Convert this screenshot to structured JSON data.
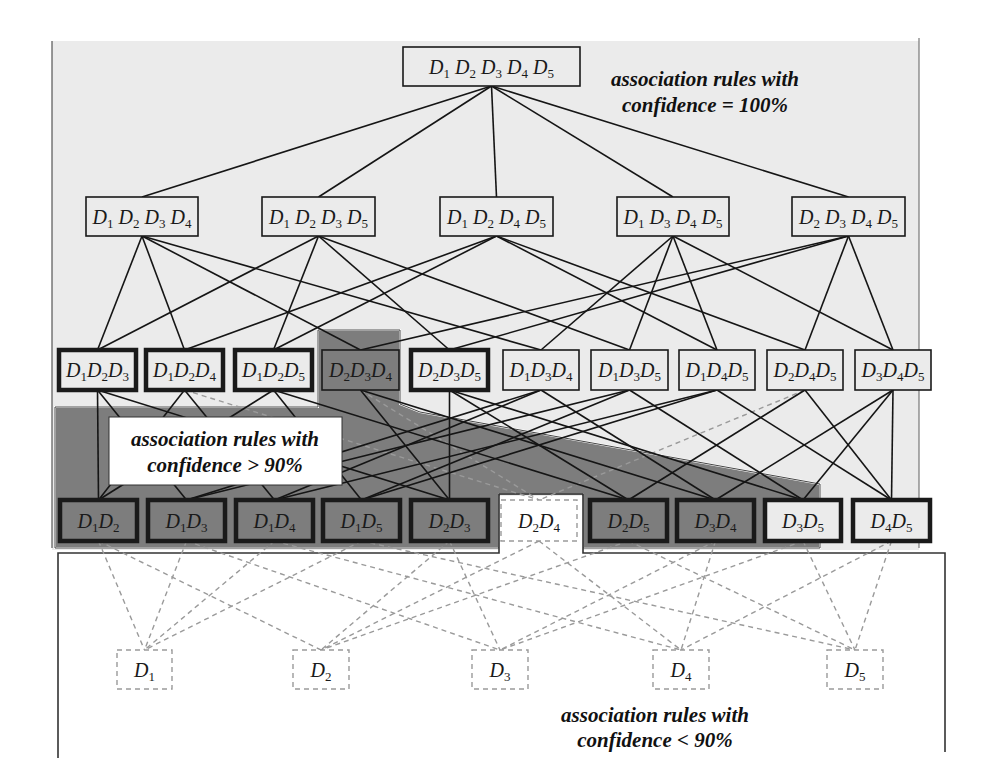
{
  "annotations": {
    "conf_100": {
      "line1": "association rules with",
      "line2": "confidence = 100%"
    },
    "conf_gt_90": {
      "line1": "association rules with",
      "line2": "confidence > 90%"
    },
    "conf_lt_90": {
      "line1": "association rules with",
      "line2": "confidence < 90%"
    }
  },
  "colors": {
    "region_100": "#ebebeb",
    "region_gt_90": "#7d7d7d",
    "region_lt_90": "#ffffff",
    "edge_solid": "#151515",
    "edge_dashed": "#9a9a9a",
    "node_border": "#1a1a1a"
  },
  "levels": {
    "level5": [
      {
        "id": "D1D2D3D4D5",
        "items": [
          "1",
          "2",
          "3",
          "4",
          "5"
        ],
        "style": "plain"
      }
    ],
    "level4": [
      {
        "id": "D1D2D3D4",
        "items": [
          "1",
          "2",
          "3",
          "4"
        ],
        "style": "plain"
      },
      {
        "id": "D1D2D3D5",
        "items": [
          "1",
          "2",
          "3",
          "5"
        ],
        "style": "plain"
      },
      {
        "id": "D1D2D4D5",
        "items": [
          "1",
          "2",
          "4",
          "5"
        ],
        "style": "plain"
      },
      {
        "id": "D1D3D4D5",
        "items": [
          "1",
          "3",
          "4",
          "5"
        ],
        "style": "plain"
      },
      {
        "id": "D2D3D4D5",
        "items": [
          "2",
          "3",
          "4",
          "5"
        ],
        "style": "plain"
      }
    ],
    "level3": [
      {
        "id": "D1D2D3",
        "items": [
          "1",
          "2",
          "3"
        ],
        "style": "bold"
      },
      {
        "id": "D1D2D4",
        "items": [
          "1",
          "2",
          "4"
        ],
        "style": "bold"
      },
      {
        "id": "D1D2D5",
        "items": [
          "1",
          "2",
          "5"
        ],
        "style": "bold"
      },
      {
        "id": "D2D3D4",
        "items": [
          "2",
          "3",
          "4"
        ],
        "style": "shaded"
      },
      {
        "id": "D2D3D5",
        "items": [
          "2",
          "3",
          "5"
        ],
        "style": "bold"
      },
      {
        "id": "D1D3D4",
        "items": [
          "1",
          "3",
          "4"
        ],
        "style": "plain"
      },
      {
        "id": "D1D3D5",
        "items": [
          "1",
          "3",
          "5"
        ],
        "style": "plain"
      },
      {
        "id": "D1D4D5",
        "items": [
          "1",
          "4",
          "5"
        ],
        "style": "plain"
      },
      {
        "id": "D2D4D5",
        "items": [
          "2",
          "4",
          "5"
        ],
        "style": "plain"
      },
      {
        "id": "D3D4D5",
        "items": [
          "3",
          "4",
          "5"
        ],
        "style": "plain"
      }
    ],
    "level2": [
      {
        "id": "D1D2",
        "items": [
          "1",
          "2"
        ],
        "style": "bold-shaded"
      },
      {
        "id": "D1D3",
        "items": [
          "1",
          "3"
        ],
        "style": "bold-shaded"
      },
      {
        "id": "D1D4",
        "items": [
          "1",
          "4"
        ],
        "style": "bold-shaded"
      },
      {
        "id": "D1D5",
        "items": [
          "1",
          "5"
        ],
        "style": "bold-shaded"
      },
      {
        "id": "D2D3",
        "items": [
          "2",
          "3"
        ],
        "style": "bold-shaded"
      },
      {
        "id": "D2D4",
        "items": [
          "2",
          "4"
        ],
        "style": "dashed"
      },
      {
        "id": "D2D5",
        "items": [
          "2",
          "5"
        ],
        "style": "bold-shaded"
      },
      {
        "id": "D3D4",
        "items": [
          "3",
          "4"
        ],
        "style": "bold-shaded"
      },
      {
        "id": "D3D5",
        "items": [
          "3",
          "5"
        ],
        "style": "bold"
      },
      {
        "id": "D4D5",
        "items": [
          "4",
          "5"
        ],
        "style": "bold"
      }
    ],
    "level1": [
      {
        "id": "D1",
        "items": [
          "1"
        ],
        "style": "dashed"
      },
      {
        "id": "D2",
        "items": [
          "2"
        ],
        "style": "dashed"
      },
      {
        "id": "D3",
        "items": [
          "3"
        ],
        "style": "dashed"
      },
      {
        "id": "D4",
        "items": [
          "4"
        ],
        "style": "dashed"
      },
      {
        "id": "D5",
        "items": [
          "5"
        ],
        "style": "dashed"
      }
    ]
  },
  "item_symbol": "D"
}
